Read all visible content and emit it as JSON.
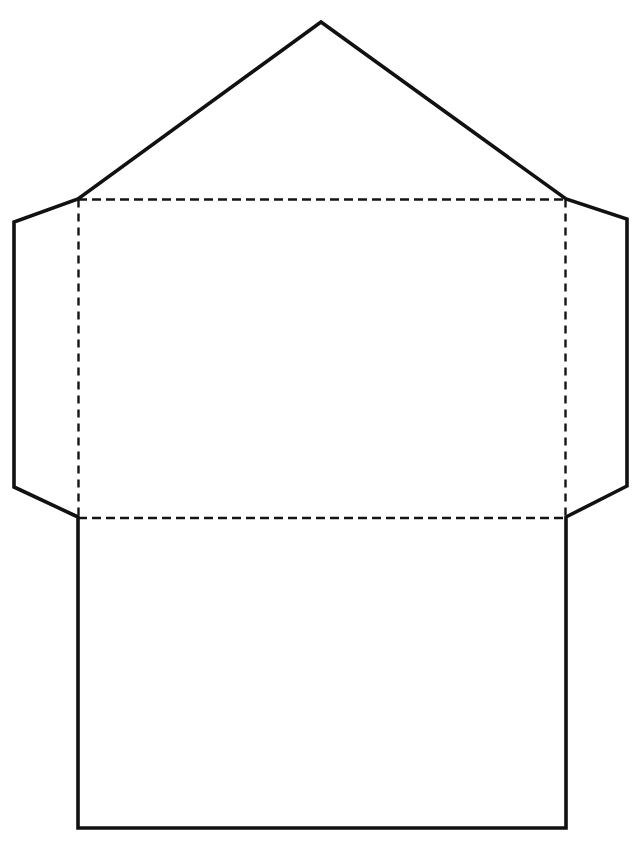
{
  "document": {
    "title": "Envelope Template Outline",
    "kind": "line-art-template",
    "canvas": {
      "width": 643,
      "height": 841,
      "background_color": "#ffffff"
    }
  },
  "styles": {
    "outline_color": "#111111",
    "outline_width": 3.6,
    "fold_color": "#141414",
    "fold_width": 2.4,
    "fold_dash_horizontal": "9 5",
    "fold_dash_vertical": "8 6",
    "fill_color": "#ffffff"
  },
  "shapes": {
    "envelope_outline": {
      "name": "envelope-cut-outline",
      "description": "Closed polygon: top triangular seal flap, two side flaps, rectangular body.",
      "points": "321,22 566,199 627,219 627,486 566,517 566,828 78,828 78,517 14,487 14,222 78,199"
    },
    "fold_top_flap": {
      "name": "top-flap-fold",
      "description": "Horizontal dashed fold separating the triangular seal flap from the body.",
      "x1": 78,
      "y1": 199.5,
      "x2": 566,
      "y2": 199.5,
      "dash": "9 5"
    },
    "fold_bottom_flap": {
      "name": "bottom-flap-fold",
      "description": "Horizontal dashed fold separating the body panel from the lower panel.",
      "x1": 78,
      "y1": 518,
      "x2": 566,
      "y2": 518,
      "dash": "9 5"
    },
    "fold_left_side": {
      "name": "left-side-fold",
      "description": "Vertical dashed fold for the left side flap.",
      "x1": 78.5,
      "y1": 199.5,
      "x2": 78.5,
      "y2": 518,
      "dash": "8 6"
    },
    "fold_right_side": {
      "name": "right-side-fold",
      "description": "Vertical dashed fold for the right side flap.",
      "x1": 565.5,
      "y1": 199.5,
      "x2": 565.5,
      "y2": 518,
      "dash": "8 6"
    }
  }
}
